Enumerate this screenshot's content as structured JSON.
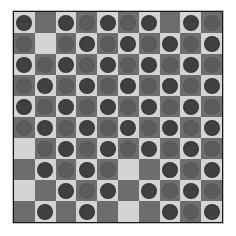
{
  "game": {
    "name": "checkerboard",
    "rows": 10,
    "cols": 10,
    "colors": {
      "light_square": "#d4d4d4",
      "dark_square": "#6d6d6d",
      "piece_on_light": "#404040",
      "piece_on_dark": "#5c5c5c",
      "border": "#1a1a1a"
    },
    "legend": {
      "P": "piece",
      ".": "empty"
    },
    "board": [
      "P.PPPPP.PP",
      "P.PPPPPPPP",
      "PPPPPPPPPP",
      "PPPPPPPPPP",
      "PPPPPPPPPP",
      "PPPPPPPPPP",
      ".PPPPPPPPP",
      ".PPPP..PPP",
      "..PPP.PPPP",
      ".P.P...PPP"
    ]
  }
}
